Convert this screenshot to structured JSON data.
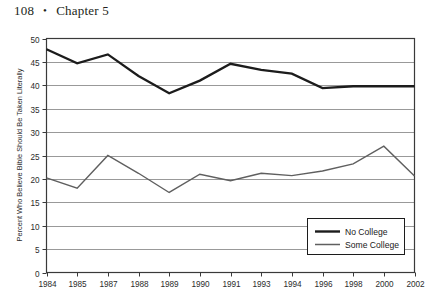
{
  "page": {
    "folio": "108",
    "separator": "•",
    "chapter": "Chapter 5"
  },
  "colors": {
    "no_college_line": "#1c1c1c",
    "some_college_line": "#5f5f5f",
    "gridline": "#8d8d8d",
    "frame": "#3a3a3a",
    "text": "#2b2b2b",
    "background": "#ffffff"
  },
  "chart_data": {
    "type": "line",
    "title": "",
    "xlabel": "",
    "ylabel": "Percent Who Believe Bible Should Be Taken Literally",
    "ylim": [
      0,
      50
    ],
    "ytick_step": 5,
    "yticks": [
      "0",
      "5",
      "10",
      "15",
      "20",
      "25",
      "30",
      "35",
      "40",
      "45",
      "50"
    ],
    "grid": "horizontal",
    "legend_position": "lower-right",
    "categories": [
      "1984",
      "1985",
      "1987",
      "1988",
      "1989",
      "1990",
      "1991",
      "1993",
      "1994",
      "1996",
      "1998",
      "2000",
      "2002"
    ],
    "series": [
      {
        "name": "No College",
        "values": [
          47.7,
          44.7,
          46.6,
          42.0,
          38.3,
          41.0,
          44.6,
          43.3,
          42.5,
          39.4,
          39.8,
          39.8,
          39.8
        ]
      },
      {
        "name": "Some College",
        "values": [
          20.2,
          18.0,
          25.0,
          21.2,
          17.1,
          21.0,
          19.6,
          21.2,
          20.7,
          21.7,
          23.2,
          27.0,
          20.6
        ]
      }
    ]
  }
}
